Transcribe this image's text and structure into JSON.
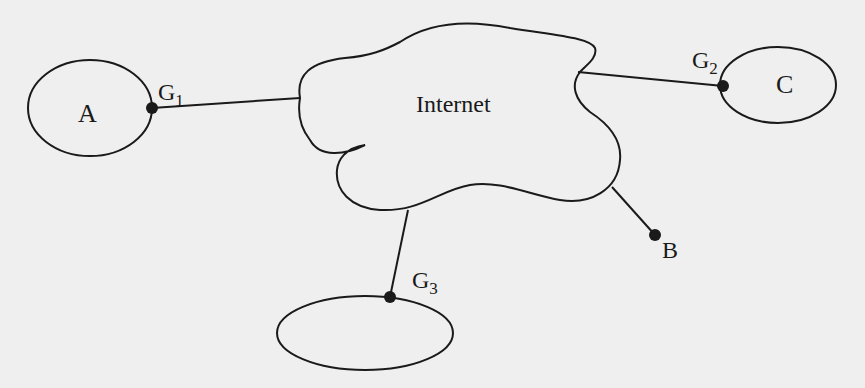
{
  "diagram": {
    "cloud_label": "Internet",
    "networks": [
      {
        "id": "A",
        "label": "A"
      },
      {
        "id": "C",
        "label": "C"
      },
      {
        "id": "G3net",
        "label": ""
      }
    ],
    "gateways": [
      {
        "id": "G1",
        "base": "G",
        "sub": "1"
      },
      {
        "id": "G2",
        "base": "G",
        "sub": "2"
      },
      {
        "id": "G3",
        "base": "G",
        "sub": "3"
      }
    ],
    "host": {
      "id": "B",
      "label": "B"
    },
    "colors": {
      "stroke": "#1a1a1a",
      "background": "#efefef"
    }
  }
}
